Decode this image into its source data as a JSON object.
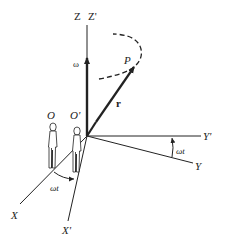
{
  "diagram": {
    "labels": {
      "z": "Z",
      "z_prime": "Z'",
      "omega": "ω",
      "point": "P",
      "position_vector": "r",
      "observer": "O",
      "observer_prime": "O'",
      "y": "Y",
      "y_prime": "Y'",
      "x": "X",
      "x_prime": "X'",
      "angle_xy": "ωt",
      "angle_x": "ωt"
    },
    "colors": {
      "ink": "#222222",
      "background": "#ffffff"
    }
  }
}
